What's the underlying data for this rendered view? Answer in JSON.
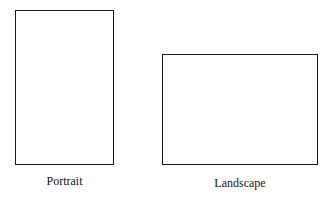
{
  "figure": {
    "items": [
      {
        "orientation": "portrait",
        "label": "Portrait"
      },
      {
        "orientation": "landscape",
        "label": "Landscape"
      }
    ]
  }
}
